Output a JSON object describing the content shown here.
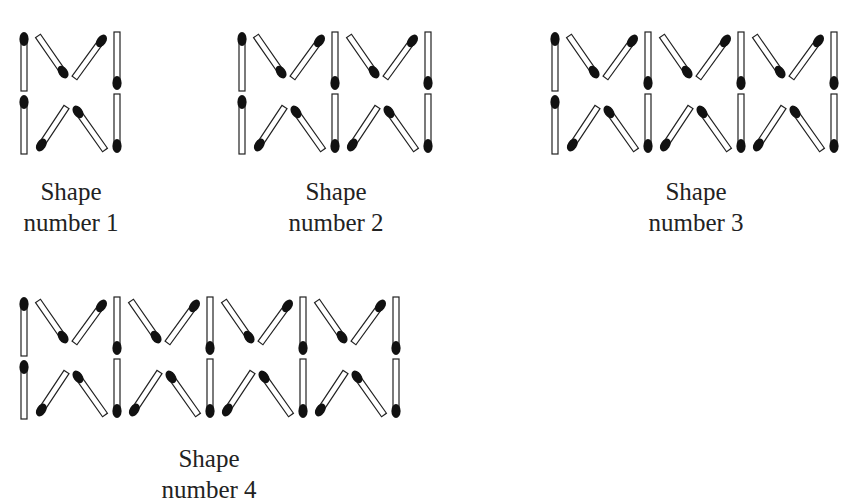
{
  "figure": {
    "shapes": [
      {
        "id": 1,
        "units": 1,
        "title": "Shape",
        "caption": "number 1",
        "x": 20,
        "y": 30,
        "label_cx": 71,
        "label_y": 176
      },
      {
        "id": 2,
        "units": 2,
        "title": "Shape",
        "caption": "number 2",
        "x": 238,
        "y": 30,
        "label_cx": 336,
        "label_y": 176
      },
      {
        "id": 3,
        "units": 3,
        "title": "Shape",
        "caption": "number 3",
        "x": 551,
        "y": 30,
        "label_cx": 696,
        "label_y": 176
      },
      {
        "id": 4,
        "units": 4,
        "title": "Shape",
        "caption": "number 4",
        "x": 20,
        "y": 295,
        "label_cx": 209,
        "label_y": 443
      }
    ],
    "unit_width": 93,
    "colors": {
      "stick_outline": "#222222",
      "stick_fill": "#ffffff",
      "match_head": "#111111",
      "text": "#222222"
    }
  }
}
